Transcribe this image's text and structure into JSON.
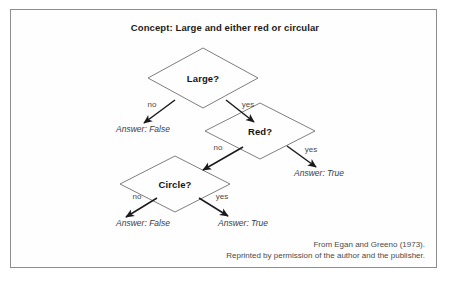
{
  "figure": {
    "title": "Concept: Large and either red or circular",
    "border_color": "#8d8d8d",
    "background_color": "#ffffff",
    "ink_color": "#141414"
  },
  "tree": {
    "nodes": [
      {
        "id": "large",
        "label": "Large?",
        "cx": 203,
        "cy": 78,
        "rx": 55,
        "ry": 30
      },
      {
        "id": "red",
        "label": "Red?",
        "cx": 260,
        "cy": 131,
        "rx": 55,
        "ry": 28
      },
      {
        "id": "circle",
        "label": "Circle?",
        "cx": 175,
        "cy": 184,
        "rx": 55,
        "ry": 28
      }
    ],
    "edges": [
      {
        "id": "large-no",
        "label": "no",
        "label_x": 152,
        "label_y": 104,
        "x1": 175,
        "y1": 100,
        "x2": 144,
        "y2": 123
      },
      {
        "id": "large-yes",
        "label": "yes",
        "label_x": 248,
        "label_y": 104,
        "x1": 226,
        "y1": 100,
        "x2": 254,
        "y2": 122
      },
      {
        "id": "red-no",
        "label": "no",
        "label_x": 218,
        "label_y": 147,
        "x1": 243,
        "y1": 147,
        "x2": 203,
        "y2": 170
      },
      {
        "id": "red-yes",
        "label": "yes",
        "label_x": 311,
        "label_y": 149,
        "x1": 287,
        "y1": 146,
        "x2": 316,
        "y2": 167
      },
      {
        "id": "circle-no",
        "label": "no",
        "label_x": 137,
        "label_y": 196,
        "x1": 157,
        "y1": 198,
        "x2": 126,
        "y2": 217
      },
      {
        "id": "circle-yes",
        "label": "yes",
        "label_x": 222,
        "label_y": 196,
        "x1": 199,
        "y1": 198,
        "x2": 228,
        "y2": 216
      }
    ],
    "leaves": [
      {
        "id": "large-no-answer",
        "label": "Answer: False",
        "x": 143,
        "y": 129
      },
      {
        "id": "red-yes-answer",
        "label": "Answer: True",
        "x": 319,
        "y": 173
      },
      {
        "id": "circle-no-answer",
        "label": "Answer: False",
        "x": 143,
        "y": 223
      },
      {
        "id": "circle-yes-answer",
        "label": "Answer: True",
        "x": 243,
        "y": 223
      }
    ]
  },
  "caption": {
    "line1": "From Egan and Greeno (1973).",
    "line2": "Reprinted by permission of the author and the publisher."
  }
}
